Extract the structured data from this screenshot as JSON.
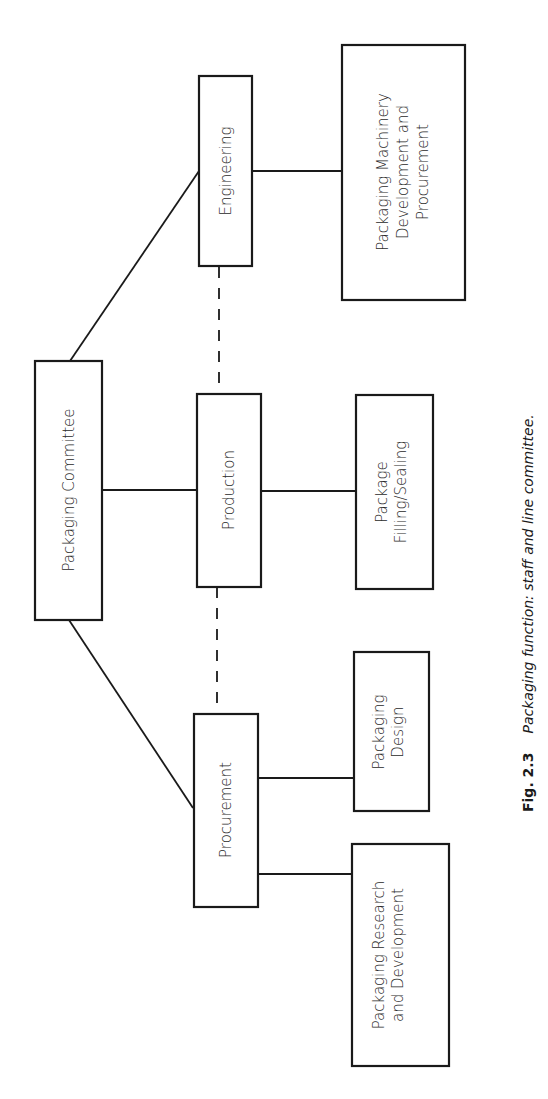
{
  "figure": {
    "number": "Fig. 2.3",
    "caption": "Packaging function: staff and line committee."
  },
  "nodes": {
    "committee": {
      "label": "Packaging Committee"
    },
    "engineering": {
      "label": "Engineering"
    },
    "production": {
      "label": "Production"
    },
    "procurement": {
      "label": "Procurement"
    },
    "machinery": {
      "lines": [
        "Packaging Machinery",
        "Development and",
        "Procurement"
      ]
    },
    "filling": {
      "lines": [
        "Package",
        "Filling/Sealing"
      ]
    },
    "design": {
      "lines": [
        "Packaging",
        "Design"
      ]
    },
    "research": {
      "lines": [
        "Packaging Research",
        "and Development"
      ]
    }
  },
  "edges": [
    {
      "from": "committee",
      "to": "engineering",
      "style": "solid"
    },
    {
      "from": "committee",
      "to": "production",
      "style": "solid"
    },
    {
      "from": "committee",
      "to": "procurement",
      "style": "solid"
    },
    {
      "from": "engineering",
      "to": "machinery",
      "style": "solid"
    },
    {
      "from": "production",
      "to": "filling",
      "style": "solid"
    },
    {
      "from": "procurement",
      "to": "design",
      "style": "solid"
    },
    {
      "from": "procurement",
      "to": "research",
      "style": "solid"
    },
    {
      "from": "engineering",
      "to": "production",
      "style": "dashed"
    },
    {
      "from": "production",
      "to": "procurement",
      "style": "dashed"
    }
  ]
}
